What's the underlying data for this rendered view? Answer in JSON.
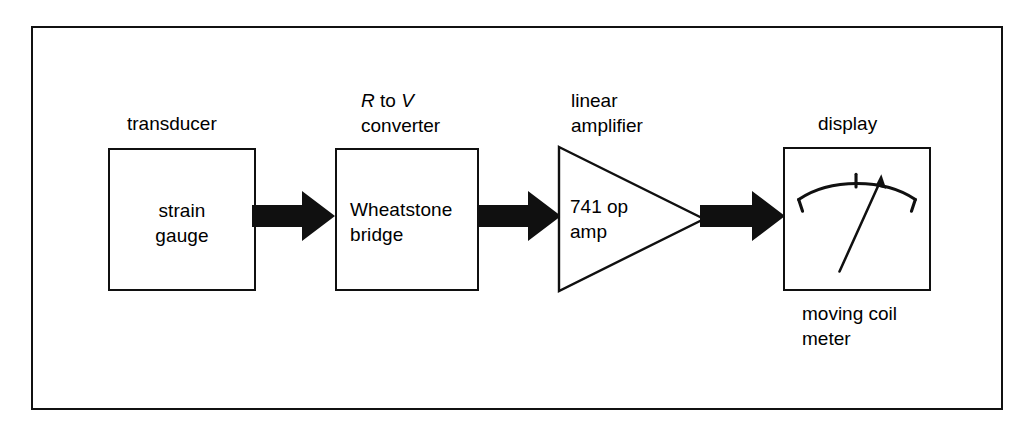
{
  "figure": {
    "background_color": "#ffffff",
    "ink_color": "#101010",
    "frame": {
      "border_px": 2
    }
  },
  "stages": {
    "transducer": {
      "caption": "transducer",
      "block_text": "strain\ngauge"
    },
    "converter": {
      "caption_line1_pre": "R",
      "caption_line1_mid": " to ",
      "caption_line1_post": "V",
      "caption_line2": "converter",
      "block_text": "Wheatstone\nbridge"
    },
    "amplifier": {
      "caption": "linear\namplifier",
      "block_text": "741 op\namp"
    },
    "display": {
      "caption": "display",
      "sub_caption": "moving coil\nmeter"
    }
  },
  "arrows": [
    {
      "name": "signal-arrow-transducer-to-converter"
    },
    {
      "name": "signal-arrow-converter-to-amplifier"
    },
    {
      "name": "signal-arrow-amplifier-to-display"
    }
  ],
  "icons": {
    "arrow": "block-arrow-right-icon",
    "meter": "analog-meter-icon",
    "triangle": "amplifier-triangle-icon"
  }
}
